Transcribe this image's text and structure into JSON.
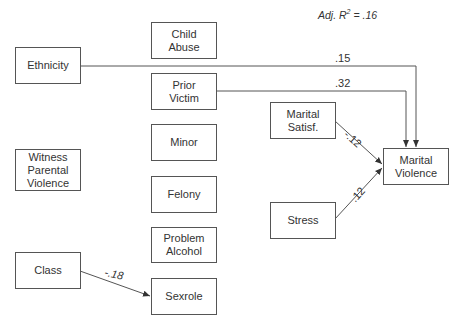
{
  "fit": {
    "label": "Adj. R",
    "sup": "2",
    "value": " = .16"
  },
  "nodes": {
    "ethnicity": "Ethnicity",
    "child_abuse": "Child\nAbuse",
    "prior_victim": "Prior\nVictim",
    "minor": "Minor",
    "witness": "Witness\nParental\nViolence",
    "felony": "Felony",
    "problem_alcohol": "Problem\nAlcohol",
    "class": "Class",
    "sexrole": "Sexrole",
    "marital_satisf": "Marital\nSatisf.",
    "stress": "Stress",
    "marital_violence": "Marital\nViolence"
  },
  "paths": [
    {
      "from": "Ethnicity",
      "to": "Marital Violence",
      "coef": ".15"
    },
    {
      "from": "Prior Victim",
      "to": "Marital Violence",
      "coef": ".32"
    },
    {
      "from": "Marital Satisf.",
      "to": "Marital Violence",
      "coef": "-.12"
    },
    {
      "from": "Stress",
      "to": "Marital Violence",
      "coef": ".12"
    },
    {
      "from": "Class",
      "to": "Sexrole",
      "coef": "-.18"
    }
  ]
}
